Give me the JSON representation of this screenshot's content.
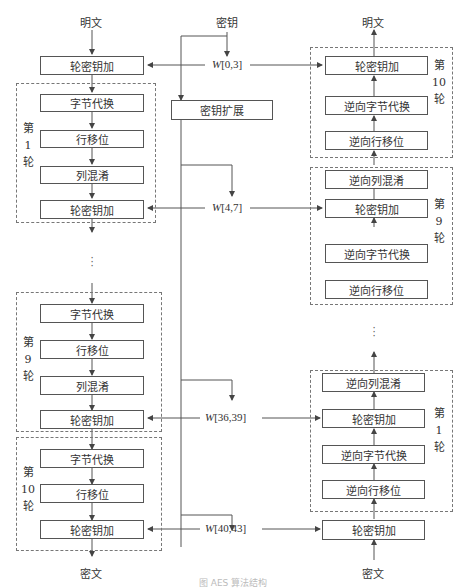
{
  "caption": "图 AES 算法结构",
  "colors": {
    "line": "#555555",
    "dashed_border": "#777777",
    "text": "#333333",
    "background": "#ffffff"
  },
  "io": {
    "enc_input": "明文",
    "enc_output": "密文",
    "key": "密钥",
    "dec_input": "密文",
    "dec_output": "明文"
  },
  "key_expansion": {
    "label": "密钥扩展"
  },
  "round_keys": [
    {
      "prefix": "W",
      "range": "[0,3]"
    },
    {
      "prefix": "W",
      "range": "[4,7]"
    },
    {
      "prefix": "W",
      "range": "[36,39]"
    },
    {
      "prefix": "W",
      "range": "[40,43]"
    }
  ],
  "encryption": {
    "initial_add_round_key": "轮密钥加",
    "rounds": [
      {
        "label": [
          "第",
          "1",
          "轮"
        ],
        "steps": [
          "字节代换",
          "行移位",
          "列混淆",
          "轮密钥加"
        ]
      },
      {
        "label": [
          "第",
          "9",
          "轮"
        ],
        "steps": [
          "字节代换",
          "行移位",
          "列混淆",
          "轮密钥加"
        ]
      },
      {
        "label": [
          "第",
          "10",
          "轮"
        ],
        "steps": [
          "字节代换",
          "行移位",
          "轮密钥加"
        ]
      }
    ],
    "ellipsis": "⋮"
  },
  "decryption": {
    "initial_add_round_key": "轮密钥加",
    "rounds": [
      {
        "label": [
          "第",
          "10",
          "轮"
        ],
        "steps": [
          "轮密钥加",
          "逆向字节代换",
          "逆向行移位"
        ]
      },
      {
        "label": [
          "第",
          "9",
          "轮"
        ],
        "steps": [
          "逆向列混淆",
          "轮密钥加",
          "逆向字节代换",
          "逆向行移位"
        ]
      },
      {
        "label": [
          "第",
          "1",
          "轮"
        ],
        "steps": [
          "逆向列混淆",
          "轮密钥加",
          "逆向字节代换",
          "逆向行移位"
        ]
      }
    ],
    "ellipsis": "⋮"
  }
}
